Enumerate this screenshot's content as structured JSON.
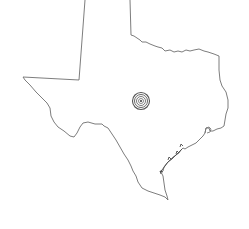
{
  "map": {
    "region": "Texas",
    "background": "#ffffff",
    "outline_color": "#6e6e6e",
    "outline_width": 0.9,
    "marker": {
      "type": "concentric-circle-target",
      "cx": 141,
      "cy": 101,
      "radii": [
        8.5,
        6.5,
        4.5,
        2.5
      ],
      "color": "#555555",
      "center_dot_color": "#333333"
    }
  }
}
